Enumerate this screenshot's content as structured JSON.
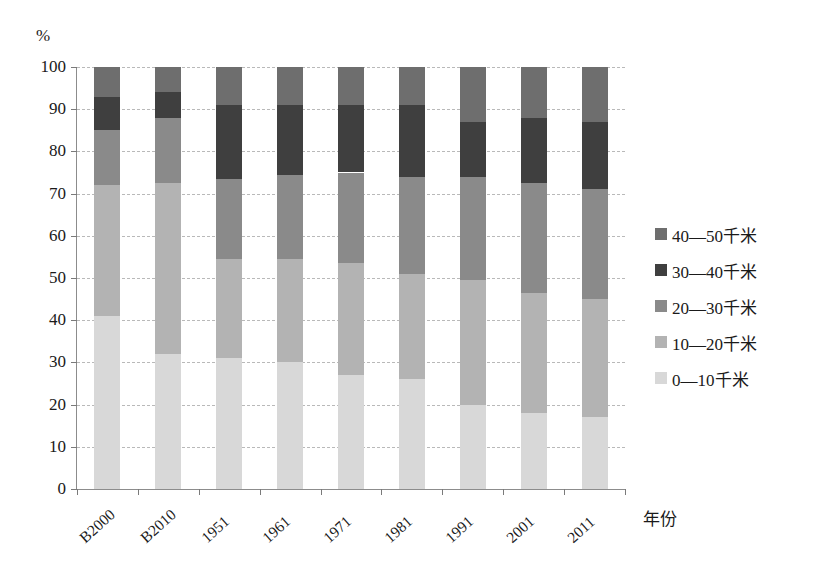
{
  "chart_data": {
    "type": "bar",
    "subtype": "stacked-percentage-column",
    "title": "",
    "xlabel": "年份",
    "ylabel": "%",
    "ylim": [
      0,
      100
    ],
    "yticks": [
      0,
      10,
      20,
      30,
      40,
      50,
      60,
      70,
      80,
      90,
      100
    ],
    "ytick_labels": [
      "0",
      "10",
      "20",
      "30",
      "40",
      "50",
      "60",
      "70",
      "80",
      "90",
      "100"
    ],
    "grid": true,
    "legend_position": "right",
    "categories": [
      "B2000",
      "B2010",
      "1951",
      "1961",
      "1971",
      "1981",
      "1991",
      "2001",
      "2011"
    ],
    "series": [
      {
        "name": "0—10千米",
        "color": "#d8d8d8",
        "values": [
          41,
          32,
          31,
          30,
          27,
          26,
          20,
          18,
          17
        ]
      },
      {
        "name": "10—20千米",
        "color": "#b3b3b3",
        "values": [
          31,
          40.5,
          23.5,
          24.5,
          26.5,
          25,
          29.5,
          28.5,
          28
        ]
      },
      {
        "name": "20—30千米",
        "color": "#8a8a8a",
        "values": [
          13,
          15.5,
          19,
          20,
          21.5,
          23,
          24.5,
          26,
          26
        ]
      },
      {
        "name": "30—40千米",
        "color": "#3f3f3f",
        "values": [
          8,
          6,
          17.5,
          16.5,
          16,
          17,
          13,
          15.5,
          16
        ]
      },
      {
        "name": "40—50千米",
        "color": "#6e6e6e",
        "values": [
          7,
          6,
          9,
          9,
          9,
          9,
          13,
          12,
          13
        ]
      }
    ],
    "cumulative_tops": [
      [
        41,
        72,
        85,
        93,
        100
      ],
      [
        32,
        72.5,
        88,
        94,
        100
      ],
      [
        31,
        54.5,
        73.5,
        91,
        100
      ],
      [
        30,
        54.5,
        74.5,
        91,
        100
      ],
      [
        27,
        53.5,
        75,
        91,
        100
      ],
      [
        26,
        51,
        74,
        91,
        100
      ],
      [
        20,
        49.5,
        74,
        87,
        100
      ],
      [
        18,
        46.5,
        72.5,
        88,
        100
      ],
      [
        17,
        45,
        71,
        87,
        100
      ]
    ]
  },
  "axes": {
    "y_unit_label": "%",
    "x_title": "年份"
  },
  "legend": {
    "entries": [
      {
        "label": "40—50千米",
        "color": "#6e6e6e"
      },
      {
        "label": "30—40千米",
        "color": "#3f3f3f"
      },
      {
        "label": "20—30千米",
        "color": "#8a8a8a"
      },
      {
        "label": "10—20千米",
        "color": "#b3b3b3"
      },
      {
        "label": "0—10千米",
        "color": "#d8d8d8"
      }
    ]
  },
  "colors": {
    "axis": "#8c8c8c",
    "gridline": "#b9b9b9",
    "background": "#ffffff",
    "text": "#1a1a1a"
  }
}
